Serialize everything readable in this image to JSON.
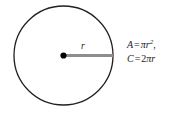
{
  "figure": {
    "type": "circle-diagram",
    "background_color": "#ffffff",
    "circle": {
      "stroke_color": "#231f20",
      "fill": "none",
      "stroke_width_px": 1.3,
      "center_x_px": 63.5,
      "center_y_px": 55.5,
      "radius_px": 49.5
    },
    "center_point": {
      "name": "center-dot",
      "color": "#000000",
      "radius_px": 3.1
    },
    "radius_segment": {
      "name": "radius-line",
      "color": "#8d8d8d",
      "stroke_width_px": 3,
      "from_x_px": 63.5,
      "from_y_px": 55.5,
      "to_x_px": 113,
      "to_y_px": 55.5
    },
    "radius_label": "r",
    "formulas": {
      "area": {
        "variable": "A",
        "equals": "=",
        "pi": "π",
        "radius": "r",
        "exponent": "2",
        "trailing": ",",
        "full_text": "A = πr²,"
      },
      "circumference": {
        "variable": "C",
        "equals": "=",
        "coefficient": "2",
        "pi": "π",
        "radius": "r",
        "full_text": "C = 2πr"
      }
    }
  }
}
